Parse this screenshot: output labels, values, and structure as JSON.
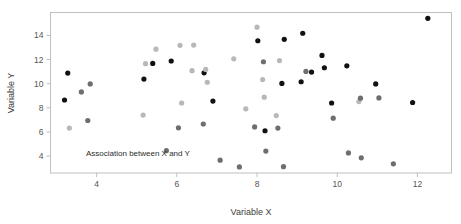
{
  "chart_data": {
    "type": "scatter",
    "title": "",
    "xlabel": "Variable X",
    "ylabel": "Variable Y",
    "annotation": "Association between X and Y",
    "xlim": [
      2.85,
      12.85
    ],
    "ylim": [
      2.6,
      15.9
    ],
    "xticks": [
      4,
      6,
      8,
      10,
      12
    ],
    "yticks": [
      4,
      6,
      8,
      10,
      12,
      14
    ],
    "xtick_labels": [
      "4",
      "6",
      "8",
      "10",
      "12"
    ],
    "ytick_labels": [
      "4",
      "6",
      "8",
      "10",
      "12",
      "14"
    ],
    "grid": false,
    "legend": "none",
    "marker": "filled-circle",
    "marker_size": 5.2,
    "colors": {
      "dark": "#111111",
      "medium": "#6e6e6e",
      "light": "#b8b8b8",
      "frame": "#bfbfbf",
      "text": "#3d3d3d",
      "background": "#ffffff"
    },
    "points": [
      {
        "x": 3.2,
        "y": 8.65,
        "shade": "dark"
      },
      {
        "x": 3.28,
        "y": 10.88,
        "shade": "dark"
      },
      {
        "x": 3.32,
        "y": 6.32,
        "shade": "light"
      },
      {
        "x": 3.62,
        "y": 9.32,
        "shade": "medium"
      },
      {
        "x": 3.78,
        "y": 6.95,
        "shade": "medium"
      },
      {
        "x": 3.84,
        "y": 9.98,
        "shade": "medium"
      },
      {
        "x": 5.16,
        "y": 7.4,
        "shade": "light"
      },
      {
        "x": 5.18,
        "y": 10.38,
        "shade": "dark"
      },
      {
        "x": 5.22,
        "y": 11.66,
        "shade": "light"
      },
      {
        "x": 5.4,
        "y": 11.68,
        "shade": "dark"
      },
      {
        "x": 5.48,
        "y": 12.86,
        "shade": "light"
      },
      {
        "x": 5.74,
        "y": 4.45,
        "shade": "medium"
      },
      {
        "x": 5.86,
        "y": 11.88,
        "shade": "dark"
      },
      {
        "x": 6.04,
        "y": 6.34,
        "shade": "medium"
      },
      {
        "x": 6.08,
        "y": 13.18,
        "shade": "light"
      },
      {
        "x": 6.12,
        "y": 8.4,
        "shade": "light"
      },
      {
        "x": 6.38,
        "y": 11.08,
        "shade": "light"
      },
      {
        "x": 6.42,
        "y": 13.2,
        "shade": "light"
      },
      {
        "x": 6.66,
        "y": 6.66,
        "shade": "medium"
      },
      {
        "x": 6.68,
        "y": 10.9,
        "shade": "dark"
      },
      {
        "x": 6.72,
        "y": 11.18,
        "shade": "light"
      },
      {
        "x": 6.76,
        "y": 10.12,
        "shade": "light"
      },
      {
        "x": 6.9,
        "y": 8.56,
        "shade": "dark"
      },
      {
        "x": 7.08,
        "y": 3.66,
        "shade": "medium"
      },
      {
        "x": 7.42,
        "y": 12.06,
        "shade": "light"
      },
      {
        "x": 7.56,
        "y": 3.1,
        "shade": "medium"
      },
      {
        "x": 7.72,
        "y": 7.92,
        "shade": "light"
      },
      {
        "x": 7.94,
        "y": 6.42,
        "shade": "medium"
      },
      {
        "x": 8.0,
        "y": 14.68,
        "shade": "light"
      },
      {
        "x": 8.02,
        "y": 13.56,
        "shade": "dark"
      },
      {
        "x": 8.14,
        "y": 10.34,
        "shade": "light"
      },
      {
        "x": 8.16,
        "y": 11.82,
        "shade": "medium"
      },
      {
        "x": 8.18,
        "y": 8.88,
        "shade": "light"
      },
      {
        "x": 8.2,
        "y": 6.1,
        "shade": "dark"
      },
      {
        "x": 8.22,
        "y": 4.42,
        "shade": "medium"
      },
      {
        "x": 8.48,
        "y": 7.36,
        "shade": "light"
      },
      {
        "x": 8.52,
        "y": 6.32,
        "shade": "medium"
      },
      {
        "x": 8.56,
        "y": 11.92,
        "shade": "light"
      },
      {
        "x": 8.62,
        "y": 10.02,
        "shade": "dark"
      },
      {
        "x": 8.66,
        "y": 3.12,
        "shade": "medium"
      },
      {
        "x": 8.68,
        "y": 13.68,
        "shade": "dark"
      },
      {
        "x": 9.1,
        "y": 10.16,
        "shade": "dark"
      },
      {
        "x": 9.14,
        "y": 14.18,
        "shade": "dark"
      },
      {
        "x": 9.22,
        "y": 11.02,
        "shade": "medium"
      },
      {
        "x": 9.36,
        "y": 10.96,
        "shade": "dark"
      },
      {
        "x": 9.62,
        "y": 12.34,
        "shade": "dark"
      },
      {
        "x": 9.68,
        "y": 11.32,
        "shade": "dark"
      },
      {
        "x": 9.86,
        "y": 8.4,
        "shade": "dark"
      },
      {
        "x": 9.9,
        "y": 7.14,
        "shade": "medium"
      },
      {
        "x": 10.24,
        "y": 11.48,
        "shade": "dark"
      },
      {
        "x": 10.28,
        "y": 4.26,
        "shade": "medium"
      },
      {
        "x": 10.54,
        "y": 8.52,
        "shade": "light"
      },
      {
        "x": 10.58,
        "y": 8.8,
        "shade": "medium"
      },
      {
        "x": 10.6,
        "y": 3.86,
        "shade": "medium"
      },
      {
        "x": 10.96,
        "y": 9.98,
        "shade": "dark"
      },
      {
        "x": 11.04,
        "y": 8.82,
        "shade": "medium"
      },
      {
        "x": 11.4,
        "y": 3.36,
        "shade": "medium"
      },
      {
        "x": 11.88,
        "y": 8.44,
        "shade": "dark"
      },
      {
        "x": 12.26,
        "y": 15.42,
        "shade": "dark"
      }
    ]
  }
}
